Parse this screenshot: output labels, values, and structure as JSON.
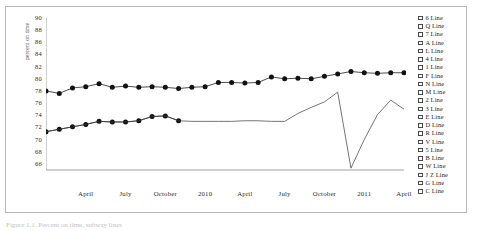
{
  "figure": {
    "caption": "Figure 1.1. Percent on time, subway lines"
  },
  "legend": {
    "items": [
      {
        "label": "6 Line"
      },
      {
        "label": "Q Line"
      },
      {
        "label": "7 Line"
      },
      {
        "label": "A Line"
      },
      {
        "label": "L Line"
      },
      {
        "label": "4 Line"
      },
      {
        "label": "1 Line"
      },
      {
        "label": "F Line"
      },
      {
        "label": "N Line"
      },
      {
        "label": "M Line"
      },
      {
        "label": "2 Line"
      },
      {
        "label": "3 Line"
      },
      {
        "label": "E Line"
      },
      {
        "label": "D Line"
      },
      {
        "label": "R Line"
      },
      {
        "label": "V Line"
      },
      {
        "label": "5 Line"
      },
      {
        "label": "B Line"
      },
      {
        "label": "W Line"
      },
      {
        "label": "J Z Line"
      },
      {
        "label": "G Line"
      },
      {
        "label": "C Line"
      }
    ]
  },
  "chart_data": {
    "type": "line",
    "title": "",
    "xlabel": "",
    "ylabel": "percent on time",
    "ylim": [
      65,
      90
    ],
    "yticks": [
      90,
      88,
      86,
      84,
      82,
      80,
      78,
      76,
      74,
      72,
      70,
      68,
      66
    ],
    "grid": false,
    "legend_position": "right",
    "xticks": [
      "April",
      "July",
      "October",
      "2010",
      "April",
      "July",
      "October",
      "2011",
      "April"
    ],
    "xtick_positions": [
      3,
      6,
      9,
      12,
      15,
      18,
      21,
      24,
      27
    ],
    "x": [
      0,
      1,
      2,
      3,
      4,
      5,
      6,
      7,
      8,
      9,
      10,
      11,
      12,
      13,
      14,
      15,
      16,
      17,
      18,
      19,
      20,
      21,
      22,
      23,
      24,
      25,
      26,
      27
    ],
    "series": [
      {
        "name": "upper-marked",
        "marker": "circle",
        "values": [
          78.0,
          77.6,
          78.5,
          78.7,
          79.2,
          78.6,
          78.8,
          78.6,
          78.7,
          78.6,
          78.4,
          78.6,
          78.7,
          79.4,
          79.4,
          79.3,
          79.4,
          80.3,
          80.0,
          80.1,
          80.0,
          80.4,
          80.8,
          81.2,
          81.0,
          80.9,
          81.0,
          81.0
        ]
      },
      {
        "name": "lower-marked",
        "marker": "circle",
        "values": [
          71.3,
          71.7,
          72.1,
          72.5,
          73.0,
          72.9,
          72.9,
          73.1,
          73.8,
          73.9,
          73.1,
          null,
          null,
          null,
          null,
          null,
          null,
          null,
          null,
          null,
          null,
          null,
          null,
          null,
          null,
          null,
          null,
          null
        ]
      },
      {
        "name": "thin-line",
        "marker": "none",
        "values": [
          71.3,
          71.7,
          72.1,
          72.5,
          73.0,
          72.9,
          72.9,
          73.1,
          73.8,
          73.9,
          73.1,
          73.0,
          73.0,
          73.0,
          73.0,
          73.1,
          73.1,
          73.0,
          73.0,
          74.3,
          75.3,
          76.2,
          77.8,
          65.3,
          70.0,
          74.1,
          76.5,
          75.0
        ]
      }
    ]
  }
}
